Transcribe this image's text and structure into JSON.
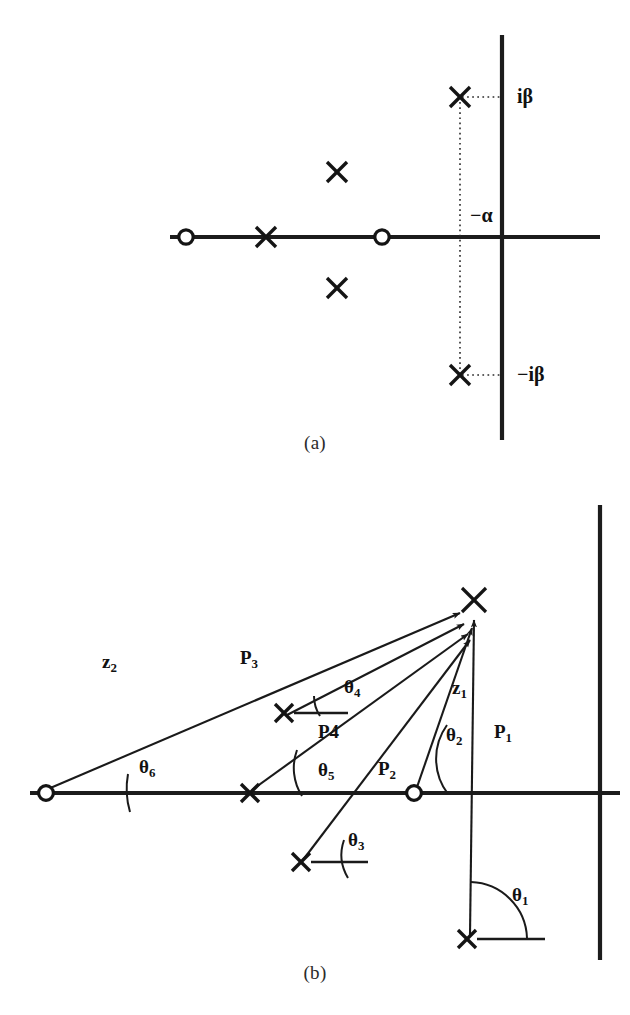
{
  "figure": {
    "panel_a": {
      "caption": "(a)",
      "labels": {
        "imag_pos": "iβ",
        "imag_neg": "−iβ",
        "real_neg": "−α"
      },
      "markers": {
        "zeros": [
          {
            "name": "zero-left",
            "x": 186,
            "y": 237
          },
          {
            "name": "zero-right",
            "x": 382,
            "y": 237
          }
        ],
        "poles": [
          {
            "name": "pole-real",
            "x": 266,
            "y": 237
          },
          {
            "name": "pole-upper-mid",
            "x": 337,
            "y": 172
          },
          {
            "name": "pole-lower-mid",
            "x": 337,
            "y": 288
          },
          {
            "name": "pole-conj-upper",
            "x": 460,
            "y": 97
          },
          {
            "name": "pole-conj-lower",
            "x": 460,
            "y": 375
          }
        ]
      },
      "axes": {
        "origin_x": 502,
        "origin_y": 237
      }
    },
    "panel_b": {
      "caption": "(b)",
      "angle_labels": [
        {
          "key": "theta1",
          "base": "θ",
          "sub": "1"
        },
        {
          "key": "theta2",
          "base": "θ",
          "sub": "2"
        },
        {
          "key": "theta3",
          "base": "θ",
          "sub": "3"
        },
        {
          "key": "theta4",
          "base": "θ",
          "sub": "4"
        },
        {
          "key": "theta5",
          "base": "θ",
          "sub": "5"
        },
        {
          "key": "theta6",
          "base": "θ",
          "sub": "6"
        }
      ],
      "vector_labels": [
        {
          "key": "P1",
          "base": "P",
          "sub": "1"
        },
        {
          "key": "P2",
          "base": "P",
          "sub": "2"
        },
        {
          "key": "P3",
          "base": "P",
          "sub": "3"
        },
        {
          "key": "P4",
          "base": "P4",
          "sub": ""
        },
        {
          "key": "z1",
          "base": "z",
          "sub": "1"
        },
        {
          "key": "z2",
          "base": "z",
          "sub": "2"
        }
      ],
      "text": {
        "theta1": "θ",
        "theta1_sub": "1",
        "theta2": "θ",
        "theta2_sub": "2",
        "theta3": "θ",
        "theta3_sub": "3",
        "theta4": "θ",
        "theta4_sub": "4",
        "theta5": "θ",
        "theta5_sub": "5",
        "theta6": "θ",
        "theta6_sub": "6",
        "P1": "P",
        "P1_sub": "1",
        "P2": "P",
        "P2_sub": "2",
        "P3": "P",
        "P3_sub": "3",
        "P4": "P4",
        "z1": "z",
        "z1_sub": "1",
        "z2": "z",
        "z2_sub": "2"
      },
      "markers": {
        "zeros": [
          {
            "name": "zero-far-left",
            "x": 46,
            "y": 793
          },
          {
            "name": "zero-right",
            "x": 414,
            "y": 793
          }
        ],
        "poles": [
          {
            "name": "pole-real",
            "x": 250,
            "y": 793
          },
          {
            "name": "pole-theta4",
            "x": 284,
            "y": 713
          },
          {
            "name": "pole-theta3",
            "x": 301,
            "y": 862
          },
          {
            "name": "pole-theta1",
            "x": 467,
            "y": 939
          },
          {
            "name": "pole-evaluation-point",
            "x": 474,
            "y": 600
          }
        ]
      },
      "axes": {
        "origin_x": 600,
        "origin_y": 793
      }
    }
  },
  "colors": {
    "ink": "#1a1a1a",
    "background": "#ffffff",
    "dotted": "#2a2a2a"
  }
}
